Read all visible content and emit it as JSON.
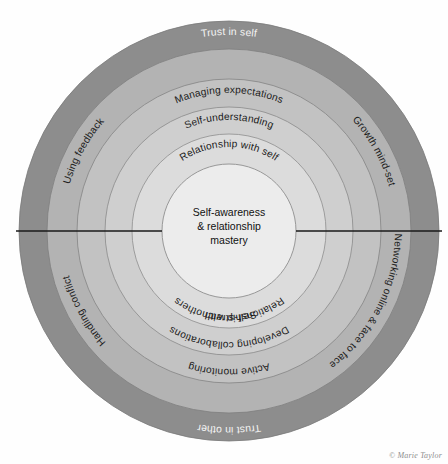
{
  "diagram": {
    "center": {
      "lines": [
        "Self-awareness",
        "& relationship",
        "mastery"
      ]
    },
    "credit": "© Marie Taylor",
    "colors": {
      "background": "#fefefe",
      "ring_outer": "#8d8d8d",
      "ring_4": "#b3b3b3",
      "ring_3": "#c2c2c2",
      "ring_2": "#cfcfcf",
      "ring_1": "#dcdcdc",
      "core": "#ececec",
      "stroke": "#6a6a6a",
      "divider": "#1a1a1a",
      "text_dark": "#1c1c1c",
      "text_light": "#f4f4f4"
    },
    "rings": [
      {
        "index": 1,
        "name": "outer-ring",
        "fill": "#8d8d8d",
        "labels": [
          {
            "text": "Trust in self",
            "position": "top",
            "style": "light"
          },
          {
            "text": "Trust in other",
            "position": "bottom",
            "style": "light"
          }
        ]
      },
      {
        "index": 2,
        "name": "ring-4",
        "fill": "#b3b3b3",
        "labels": [
          {
            "text": "Using feedback",
            "position": "upper-left",
            "style": "dark"
          },
          {
            "text": "Growth mind-set",
            "position": "upper-right",
            "style": "dark"
          },
          {
            "text": "Handling conflict",
            "position": "lower-left",
            "style": "dark"
          },
          {
            "text": "Networking online & face to face",
            "position": "lower-right",
            "style": "dark"
          }
        ]
      },
      {
        "index": 3,
        "name": "ring-3",
        "fill": "#c2c2c2",
        "labels": [
          {
            "text": "Managing expectations",
            "position": "top",
            "style": "dark"
          },
          {
            "text": "Active monitoring",
            "position": "bottom",
            "style": "dark"
          }
        ]
      },
      {
        "index": 4,
        "name": "ring-2",
        "fill": "#cfcfcf",
        "labels": [
          {
            "text": "Self-understanding",
            "position": "top",
            "style": "dark"
          },
          {
            "text": "Developing collaborations",
            "position": "bottom",
            "style": "dark"
          }
        ]
      },
      {
        "index": 5,
        "name": "ring-1",
        "fill": "#dcdcdc",
        "labels": [
          {
            "text": "Relationship with self",
            "position": "top",
            "style": "dark"
          },
          {
            "text": "Self-stretch",
            "position": "bottom",
            "style": "dark"
          }
        ]
      },
      {
        "index": 6,
        "name": "core-circle",
        "fill": "#ececec",
        "labels": [
          {
            "text": "Relationship with others",
            "position": "below-core",
            "style": "dark"
          }
        ]
      }
    ]
  }
}
